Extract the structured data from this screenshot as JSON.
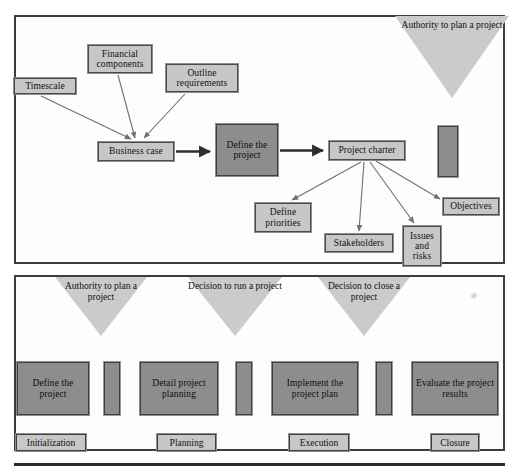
{
  "diagram": {
    "colors": {
      "panel_border": "#3d3d3d",
      "box_light_fill": "#c7c7c7",
      "box_dark_fill": "#8d8d8d",
      "triangle_fill": "#cbcbcb",
      "arrow_thin": "#6f6f6f",
      "arrow_thick": "#2e2e2e",
      "background": "#ffffff"
    }
  },
  "top_panel": {
    "inputs": [
      {
        "id": "timescale",
        "label": "Timescale"
      },
      {
        "id": "financial-components",
        "label": "Financial components"
      },
      {
        "id": "outline-requirements",
        "label": "Outline requirements"
      }
    ],
    "process": [
      {
        "id": "business-case",
        "label": "Business case",
        "style": "light"
      },
      {
        "id": "define-the-project",
        "label": "Define the project",
        "style": "dark"
      },
      {
        "id": "project-charter",
        "label": "Project charter",
        "style": "light"
      }
    ],
    "outputs": [
      {
        "id": "define-priorities",
        "label": "Define priorities"
      },
      {
        "id": "stakeholders",
        "label": "Stakeholders"
      },
      {
        "id": "issues-and-risks",
        "label": "Issues and risks"
      },
      {
        "id": "objectives",
        "label": "Objectives"
      }
    ],
    "gateway": {
      "id": "authority-to-plan-a-project",
      "label": "Authority to plan a project"
    },
    "connector_bar": {
      "id": "top-connector-bar",
      "label": ""
    }
  },
  "bottom_panel": {
    "milestones": [
      {
        "id": "authority-to-plan-a-project",
        "label": "Authority to plan a project"
      },
      {
        "id": "decision-to-run-a-project",
        "label": "Decision to run a project"
      },
      {
        "id": "decision-to-close-a-project",
        "label": "Decision to close a project"
      }
    ],
    "stages": [
      {
        "id": "define-the-project",
        "label": "Define the project"
      },
      {
        "id": "detail-project-planning",
        "label": "Detail project planning"
      },
      {
        "id": "implement-the-project-plan",
        "label": "Implement the project plan"
      },
      {
        "id": "evaluate-the-project-results",
        "label": "Evaluate the project results"
      }
    ],
    "phases": [
      {
        "id": "initialization",
        "label": "Initialization"
      },
      {
        "id": "planning",
        "label": "Planning"
      },
      {
        "id": "execution",
        "label": "Execution"
      },
      {
        "id": "closure",
        "label": "Closure"
      }
    ]
  }
}
